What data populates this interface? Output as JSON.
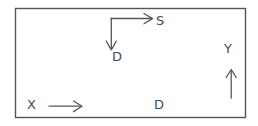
{
  "diagram": {
    "background_color": "#ffffff",
    "stroke_color": "#555555",
    "border": {
      "name": "outer-rectangle",
      "x": 15,
      "y": 8,
      "width": 231,
      "height": 110,
      "stroke_width": 1.4
    },
    "labels": {
      "s": "S",
      "d_upper": "D",
      "d_lower": "D",
      "x": "X",
      "y": "Y"
    },
    "arrows": [
      {
        "name": "s-arrow",
        "direction": "right",
        "label": "S",
        "from_x": 111,
        "from_y": 18,
        "to_x": 152,
        "to_y": 18
      },
      {
        "name": "d-arrow",
        "direction": "down",
        "label": "D",
        "from_x": 111,
        "from_y": 18,
        "to_x": 111,
        "to_y": 50
      },
      {
        "name": "x-arrow",
        "direction": "right",
        "label": "X",
        "from_x": 49,
        "from_y": 106,
        "to_x": 82,
        "to_y": 106
      },
      {
        "name": "y-arrow",
        "direction": "up",
        "label": "Y",
        "from_x": 231,
        "from_y": 98,
        "to_x": 231,
        "to_y": 70
      }
    ]
  }
}
